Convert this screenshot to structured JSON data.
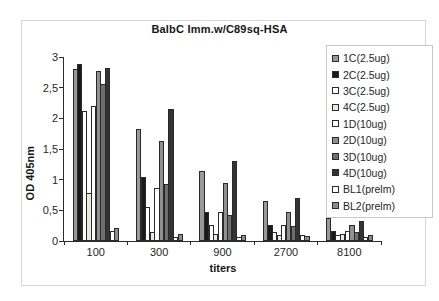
{
  "figure": {
    "title": "BalbC Imm.w/C89sq-HSA",
    "background": "#ffffff",
    "frame_color": "#d6d6d6"
  },
  "chart_data": {
    "type": "bar",
    "title": "BalbC Imm.w/C89sq-HSA",
    "xlabel": "titers",
    "ylabel": "OD 405nm",
    "ylim": [
      0,
      3
    ],
    "grid": false,
    "legend_position": "right",
    "categories": [
      "100",
      "300",
      "900",
      "2700",
      "8100"
    ],
    "y_ticks": [
      {
        "value": 0,
        "label": "0"
      },
      {
        "value": 0.5,
        "label": "0,5"
      },
      {
        "value": 1,
        "label": "1"
      },
      {
        "value": 1.5,
        "label": "1,5"
      },
      {
        "value": 2,
        "label": "2"
      },
      {
        "value": 2.5,
        "label": "2,5"
      },
      {
        "value": 3,
        "label": "3"
      }
    ],
    "series": [
      {
        "name": "1C(2.5ug)",
        "color": "#999999",
        "values": [
          2.8,
          1.82,
          1.15,
          0.65,
          0.37
        ]
      },
      {
        "name": "2C(2.5ug)",
        "color": "#1a1a1a",
        "values": [
          2.88,
          1.05,
          0.48,
          0.26,
          0.16
        ]
      },
      {
        "name": "3C(2.5ug)",
        "color": "#ffffff",
        "values": [
          2.12,
          0.55,
          0.26,
          0.15,
          0.1
        ]
      },
      {
        "name": "4C(2.5ug)",
        "color": "#ece9dd",
        "values": [
          0.78,
          0.15,
          0.12,
          0.1,
          0.11
        ]
      },
      {
        "name": "1D(10ug)",
        "color": "#ffffff",
        "values": [
          2.2,
          0.87,
          0.47,
          0.26,
          0.16
        ]
      },
      {
        "name": "2D(10ug)",
        "color": "#909090",
        "values": [
          2.78,
          1.63,
          0.94,
          0.48,
          0.26
        ]
      },
      {
        "name": "3D(10ug)",
        "color": "#6f6f6f",
        "values": [
          2.56,
          0.93,
          0.42,
          0.24,
          0.15
        ]
      },
      {
        "name": "4D(10ug)",
        "color": "#333333",
        "values": [
          2.83,
          2.15,
          1.31,
          0.7,
          0.32
        ]
      },
      {
        "name": "BL1(prelm)",
        "color": "#ffffff",
        "values": [
          0.17,
          0.06,
          0.07,
          0.09,
          0.07
        ]
      },
      {
        "name": "BL2(prelm)",
        "color": "#8c8c8c",
        "values": [
          0.21,
          0.12,
          0.1,
          0.08,
          0.1
        ]
      }
    ]
  }
}
